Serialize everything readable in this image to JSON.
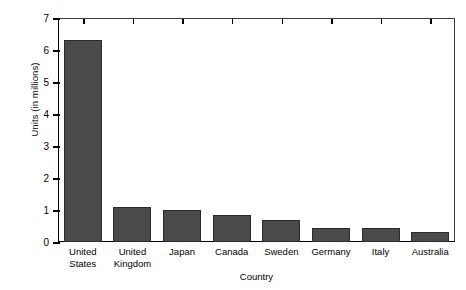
{
  "chart_data": {
    "type": "bar",
    "title": "",
    "xlabel": "Country",
    "ylabel": "Units (in millions)",
    "categories": [
      "United States",
      "United Kingdom",
      "Japan",
      "Canada",
      "Sweden",
      "Germany",
      "Italy",
      "Australia"
    ],
    "category_lines": [
      [
        "United",
        "States"
      ],
      [
        "United",
        "Kingdom"
      ],
      [
        "Japan"
      ],
      [
        "Canada"
      ],
      [
        "Sweden"
      ],
      [
        "Germany"
      ],
      [
        "Italy"
      ],
      [
        "Australia"
      ]
    ],
    "values": [
      6.3,
      1.1,
      1.0,
      0.85,
      0.7,
      0.45,
      0.45,
      0.3
    ],
    "ylim": [
      0,
      7
    ],
    "yticks": [
      0,
      1,
      2,
      3,
      4,
      5,
      6,
      7
    ],
    "ytick_labels": [
      "0",
      "1",
      "2",
      "3",
      "4",
      "5",
      "6",
      "7"
    ],
    "grid": false,
    "legend": "none",
    "bar_color": "#4a4a4a",
    "bar_edge_color": "#2b2b2b",
    "axis_color": "#000000",
    "background_color": "#ffffff"
  }
}
